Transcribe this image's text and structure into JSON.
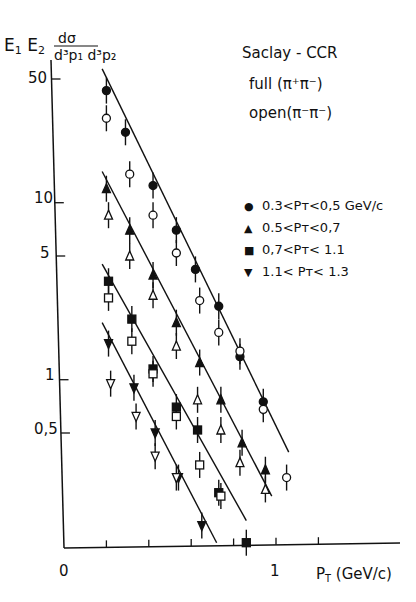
{
  "chart_data": {
    "type": "scatter",
    "title": "Saclay - CCR",
    "subtitle_lines": [
      "full (π⁺π⁻)",
      "open (π⁻π⁻)"
    ],
    "xlabel": "P_T (GeV/c)",
    "ylabel": "E1 E2 dσ / d³p1 d³p2",
    "xscale": "linear",
    "yscale": "log",
    "xlim": [
      0,
      1.3
    ],
    "ylim": [
      0.1,
      70
    ],
    "x_ticks": [
      0,
      0.2,
      0.4,
      0.6,
      0.8,
      1.0,
      1.2
    ],
    "x_tick_labels": [
      "0",
      "1"
    ],
    "y_tick_labels": [
      "50",
      "10",
      "5",
      "1",
      "0,5"
    ],
    "grid": false,
    "legend_position": "upper right",
    "legend": [
      {
        "symbol": "filled-circle",
        "label": "0.3<P_T<0,5 GeV/c"
      },
      {
        "symbol": "filled-triangle-up",
        "label": "0.5<P_T<0,7"
      },
      {
        "symbol": "filled-square",
        "label": "0,7<P_T<1.1"
      },
      {
        "symbol": "filled-triangle-down",
        "label": "1.1<P_T<1.3"
      }
    ],
    "note": "Filled markers = full (π+π-), open markers = open (π-π-). Straight lines are exponential fits through the filled points.",
    "series": [
      {
        "name": "0.3<PT<0.5 full",
        "marker": "circle",
        "filled": true,
        "x": [
          0.2,
          0.29,
          0.42,
          0.53,
          0.62,
          0.73,
          0.83,
          0.94
        ],
        "y": [
          43,
          25,
          12.5,
          7.0,
          4.2,
          2.6,
          1.35,
          0.75
        ]
      },
      {
        "name": "0.3<PT<0.5 open",
        "marker": "circle",
        "filled": false,
        "x": [
          0.2,
          0.31,
          0.42,
          0.53,
          0.64,
          0.73,
          0.83,
          0.94,
          1.05
        ],
        "y": [
          30,
          14.5,
          8.5,
          5.2,
          2.8,
          1.85,
          1.45,
          0.68,
          0.28
        ]
      },
      {
        "name": "0.5<PT<0.7 full",
        "marker": "triangle-up",
        "filled": true,
        "x": [
          0.2,
          0.31,
          0.42,
          0.53,
          0.64,
          0.74,
          0.84,
          0.95
        ],
        "y": [
          12,
          7.0,
          3.9,
          2.1,
          1.25,
          0.77,
          0.44,
          0.31
        ]
      },
      {
        "name": "0.5<PT<0.7 open",
        "marker": "triangle-up",
        "filled": false,
        "x": [
          0.21,
          0.31,
          0.42,
          0.53,
          0.63,
          0.74,
          0.83,
          0.95
        ],
        "y": [
          8.5,
          5.0,
          3.0,
          1.55,
          0.77,
          0.52,
          0.34,
          0.24
        ]
      },
      {
        "name": "0.7<PT<1.1 full",
        "marker": "square",
        "filled": true,
        "x": [
          0.21,
          0.32,
          0.42,
          0.53,
          0.63,
          0.73,
          0.86
        ],
        "y": [
          3.6,
          2.2,
          1.15,
          0.7,
          0.52,
          0.23,
          0.12
        ]
      },
      {
        "name": "0.7<PT<1.1 open",
        "marker": "square",
        "filled": false,
        "x": [
          0.21,
          0.32,
          0.42,
          0.53,
          0.64,
          0.74
        ],
        "y": [
          2.9,
          1.65,
          1.08,
          0.62,
          0.33,
          0.22
        ]
      },
      {
        "name": "1.1<PT<1.3 full",
        "marker": "triangle-down",
        "filled": true,
        "x": [
          0.21,
          0.33,
          0.43,
          0.54,
          0.65
        ],
        "y": [
          1.6,
          0.9,
          0.5,
          0.28,
          0.15
        ]
      },
      {
        "name": "1.1<PT<1.3 open",
        "marker": "triangle-down",
        "filled": false,
        "x": [
          0.22,
          0.34,
          0.43,
          0.53
        ],
        "y": [
          0.95,
          0.62,
          0.37,
          0.28
        ]
      }
    ],
    "fit_lines": [
      {
        "series": "0.3<PT<0.5",
        "x": [
          0.18,
          1.06
        ],
        "y": [
          57,
          0.39
        ]
      },
      {
        "series": "0.5<PT<0.7",
        "x": [
          0.18,
          0.98
        ],
        "y": [
          15,
          0.22
        ]
      },
      {
        "series": "0.7<PT<1.1",
        "x": [
          0.18,
          0.86
        ],
        "y": [
          4.5,
          0.16
        ]
      },
      {
        "series": "1.1<PT<1.3",
        "x": [
          0.18,
          0.72
        ],
        "y": [
          2.1,
          0.12
        ]
      }
    ]
  },
  "labels": {
    "ylabel_main": "E",
    "ylabel_sub1": "1",
    "ylabel_e2": "E",
    "ylabel_sub2": "2",
    "ylabel_num": "dσ",
    "ylabel_den": "d³p₁ d³p₂",
    "title": "Saclay - CCR",
    "subtitle1": "full (π⁺π⁻)",
    "subtitle2": "open(π⁻π⁻)",
    "legend": [
      "0.3<Pᴛ<0,5 GeV/c",
      "0.5<Pᴛ<0,7",
      "0,7<Pᴛ< 1.1",
      "1.1< Pᴛ< 1.3"
    ],
    "legend_symbols": [
      "●",
      "▲",
      "■",
      "▼"
    ],
    "y_ticks": [
      "50",
      "10",
      "5",
      "1",
      "0,5"
    ],
    "x_ticks": [
      "0",
      "1"
    ],
    "xlabel_p": "P",
    "xlabel_sub": "T",
    "xlabel_unit": "(GeV/c)"
  }
}
